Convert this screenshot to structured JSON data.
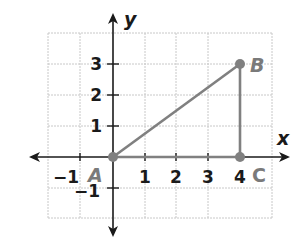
{
  "diagram": {
    "type": "coordinate-plane-triangle",
    "axes": {
      "x_label": "x",
      "y_label": "y",
      "x_ticks": [
        "−1",
        "1",
        "2",
        "3",
        "4"
      ],
      "y_ticks": [
        "3",
        "2",
        "1",
        "−1"
      ],
      "grid_x_range": [
        -2,
        5
      ],
      "grid_y_range": [
        -2,
        4
      ]
    },
    "points": [
      {
        "label": "A",
        "x": 0,
        "y": 0
      },
      {
        "label": "B",
        "x": 4,
        "y": 3
      },
      {
        "label": "C",
        "x": 4,
        "y": 0
      }
    ],
    "segments": [
      [
        "A",
        "B"
      ],
      [
        "B",
        "C"
      ],
      [
        "A",
        "C"
      ]
    ],
    "colors": {
      "axis": "#1a1a1a",
      "grid": "#c8c8c8",
      "triangle": "#808080",
      "point_label": "#7a7a7a"
    }
  }
}
